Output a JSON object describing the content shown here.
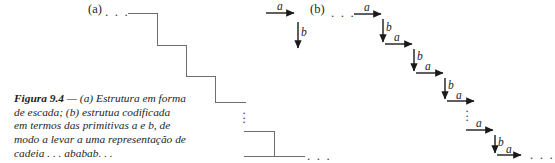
{
  "figure": {
    "caption": {
      "label": "Figura 9.4",
      "dash": "—",
      "text": "(a) Estrutura em forma de escada; (b) estrutua codificada em termos das primitivas a e b, de modo a levar a uma representação de cadeia . . . ababab. . ."
    },
    "panel_a": {
      "label": "(a)",
      "leading_ellipsis": ". . .",
      "trailing_ellipsis": ". . .",
      "vertical_ellipsis": "⋮",
      "step_count_visible": 5,
      "description": "staircase polyline descending to the right"
    },
    "legend": {
      "horizontal_primitive_label": "a",
      "vertical_primitive_label": "b"
    },
    "panel_b": {
      "label": "(b)",
      "leading_ellipsis": ". . .",
      "trailing_ellipsis": ". . .",
      "vertical_ellipsis": "⋮",
      "sequence": [
        "a",
        "b",
        "a",
        "b",
        "a",
        "b",
        "a",
        "a",
        "b",
        "a"
      ],
      "arrow_labels": {
        "a1": "a",
        "b1": "b",
        "a2": "a",
        "b2": "b",
        "a3": "a",
        "b3": "b",
        "a4": "a",
        "a5": "a",
        "b4": "b",
        "a6": "a"
      }
    },
    "colors": {
      "ink": "#231f20",
      "line": "#6e6e72",
      "arrow": "#1a1a1a",
      "background": "#ffffff"
    }
  }
}
